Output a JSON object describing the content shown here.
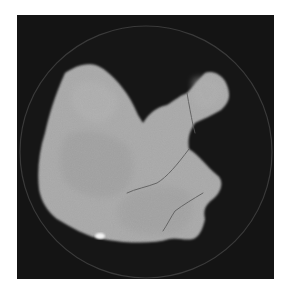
{
  "image": {
    "description": "Grayscale axial CT slice showing a large lobulated soft-tissue organ (liver) within a circular field of view on black background",
    "colors": {
      "background": "#ffffff",
      "frame": "#141414",
      "fov_ring": "#3a3a3a",
      "organ": "#a9a9a9",
      "organ_shade": "#9a9a9a",
      "vessel": "#555555",
      "calcification": "#f4f4f4"
    }
  }
}
